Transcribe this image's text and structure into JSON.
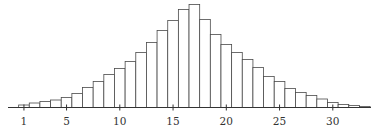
{
  "chart_data": {
    "type": "bar",
    "title": "",
    "xlabel": "",
    "ylabel": "",
    "grid": false,
    "legend": null,
    "categories": [
      1,
      2,
      3,
      4,
      5,
      6,
      7,
      8,
      9,
      10,
      11,
      12,
      13,
      14,
      15,
      16,
      17,
      18,
      19,
      20,
      21,
      22,
      23,
      24,
      25,
      26,
      27,
      28,
      29,
      30,
      31,
      32,
      33
    ],
    "values": [
      2.5,
      4.5,
      6,
      7.5,
      10,
      14,
      20,
      26,
      33,
      39,
      46,
      55,
      65,
      77,
      87,
      98,
      103,
      88,
      73,
      63,
      55,
      48,
      40,
      31,
      26,
      19,
      15,
      12,
      8.5,
      5,
      3,
      2,
      1
    ],
    "xticks": [
      1,
      5,
      10,
      15,
      20,
      25,
      30
    ],
    "xtick_labels": [
      "1",
      "5",
      "10",
      "15",
      "20",
      "25",
      "30"
    ],
    "xlim": [
      -0.5,
      34
    ],
    "ylim": [
      0,
      105
    ]
  },
  "colors": {
    "bar_fill": "#ffffff",
    "bar_stroke": "#4a4a4a",
    "axis": "#333333",
    "text": "#333333"
  }
}
